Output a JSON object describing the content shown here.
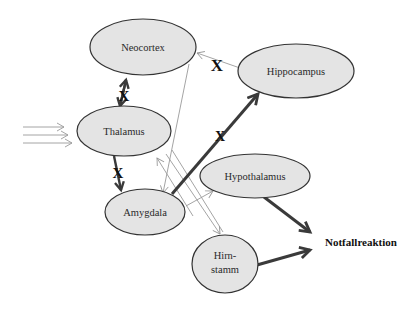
{
  "diagram": {
    "type": "brain-emotion-pathway",
    "nodes": [
      {
        "id": "neocortex",
        "label": "Neocortex"
      },
      {
        "id": "hippocampus",
        "label": "Hippocampus"
      },
      {
        "id": "thalamus",
        "label": "Thalamus"
      },
      {
        "id": "hypothalamus",
        "label": "Hypothalamus"
      },
      {
        "id": "amygdala",
        "label": "Amygdala"
      },
      {
        "id": "hirnstamm",
        "label_line1": "Hirn-",
        "label_line2": "stamm"
      }
    ],
    "output_label": "Notfallreaktion",
    "block_marker": "X",
    "edges": [
      {
        "from": "input",
        "to": "thalamus",
        "style": "thin",
        "count": 3
      },
      {
        "from": "thalamus",
        "to": "neocortex",
        "style": "thick",
        "bidirectional": true,
        "blocked": true
      },
      {
        "from": "thalamus",
        "to": "amygdala",
        "style": "thick",
        "blocked": true
      },
      {
        "from": "hippocampus",
        "to": "neocortex",
        "style": "thin",
        "blocked": true
      },
      {
        "from": "neocortex",
        "to": "amygdala",
        "style": "thin"
      },
      {
        "from": "amygdala",
        "to": "hippocampus",
        "style": "thick",
        "blocked": true
      },
      {
        "from": "amygdala",
        "to": "thalamus",
        "style": "thin"
      },
      {
        "from": "amygdala",
        "to": "hypothalamus",
        "style": "thin"
      },
      {
        "from": "thalamus",
        "to": "hirnstamm",
        "style": "thin"
      },
      {
        "from": "amygdala",
        "to": "hirnstamm",
        "style": "thin"
      },
      {
        "from": "hypothalamus",
        "to": "notfallreaktion",
        "style": "thick"
      },
      {
        "from": "hirnstamm",
        "to": "notfallreaktion",
        "style": "thick"
      }
    ]
  },
  "colors": {
    "node_fill": "#e4e4e4",
    "node_stroke": "#333333",
    "thin_arrow": "#9a9a9a",
    "thick_arrow": "#3a3a3a"
  }
}
